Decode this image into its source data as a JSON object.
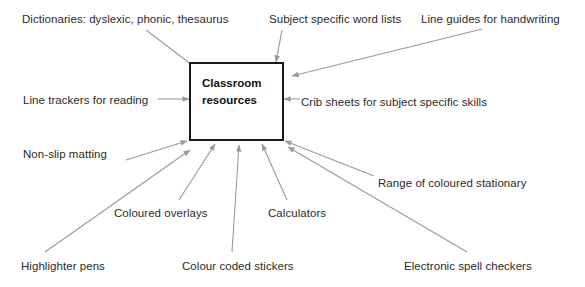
{
  "diagram": {
    "center": {
      "label": "Classroom\nresources",
      "border_color": "#1a1a1a",
      "background_color": "#ffffff"
    },
    "arrow_color": "#9a9a9a",
    "text_color": "#2b2b2b",
    "nodes": [
      {
        "id": "dictionaries",
        "label": "Dictionaries: dyslexic, phonic, thesaurus",
        "x": 22,
        "y": 12,
        "arrow": {
          "x1": 146,
          "y1": 30,
          "x2": 196,
          "y2": 68
        }
      },
      {
        "id": "word-lists",
        "label": "Subject specific word lists",
        "x": 269,
        "y": 12,
        "arrow": {
          "x1": 282,
          "y1": 30,
          "x2": 276,
          "y2": 62
        }
      },
      {
        "id": "line-guides",
        "label": "Line guides for handwriting",
        "x": 421,
        "y": 12,
        "arrow": {
          "x1": 482,
          "y1": 29,
          "x2": 292,
          "y2": 76
        }
      },
      {
        "id": "line-trackers",
        "label": "Line trackers for reading",
        "x": 23,
        "y": 93,
        "arrow": {
          "x1": 158,
          "y1": 99,
          "x2": 189,
          "y2": 99
        }
      },
      {
        "id": "crib-sheets",
        "label": "Crib sheets for subject specific skills",
        "x": 301,
        "y": 95,
        "arrow": {
          "x1": 300,
          "y1": 99,
          "x2": 284,
          "y2": 99
        }
      },
      {
        "id": "non-slip-matting",
        "label": "Non-slip matting",
        "x": 23,
        "y": 147,
        "arrow": {
          "x1": 126,
          "y1": 160,
          "x2": 187,
          "y2": 141
        }
      },
      {
        "id": "coloured-stationary",
        "label": "Range of coloured stationary",
        "x": 378,
        "y": 176,
        "arrow": {
          "x1": 374,
          "y1": 176,
          "x2": 285,
          "y2": 141
        }
      },
      {
        "id": "coloured-overlays",
        "label": "Coloured overlays",
        "x": 114,
        "y": 206,
        "arrow": {
          "x1": 179,
          "y1": 200,
          "x2": 215,
          "y2": 144
        }
      },
      {
        "id": "calculators",
        "label": "Calculators",
        "x": 268,
        "y": 206,
        "arrow": {
          "x1": 287,
          "y1": 200,
          "x2": 262,
          "y2": 144
        }
      },
      {
        "id": "highlighter-pens",
        "label": "Highlighter pens",
        "x": 21,
        "y": 259,
        "arrow": {
          "x1": 45,
          "y1": 252,
          "x2": 190,
          "y2": 150
        }
      },
      {
        "id": "colour-coded-stickers",
        "label": "Colour coded stickers",
        "x": 182,
        "y": 259,
        "arrow": {
          "x1": 232,
          "y1": 252,
          "x2": 239,
          "y2": 145
        }
      },
      {
        "id": "electronic-spell-checkers",
        "label": "Electronic spell checkers",
        "x": 404,
        "y": 259,
        "arrow": {
          "x1": 467,
          "y1": 252,
          "x2": 288,
          "y2": 147
        }
      }
    ]
  }
}
